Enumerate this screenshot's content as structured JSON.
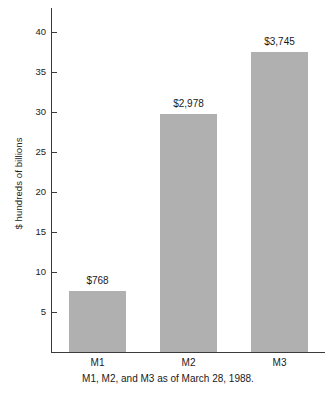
{
  "chart_data": {
    "type": "bar",
    "title": "",
    "subtitle": "",
    "xlabel": "",
    "ylabel": "$ hundreds of billions",
    "categories": [
      "M1",
      "M2",
      "M3"
    ],
    "values": [
      7.68,
      29.78,
      37.45
    ],
    "data_labels": [
      "$768",
      "$2,978",
      "$3,745"
    ],
    "ylim": [
      0,
      43
    ],
    "yticks": [
      5,
      10,
      15,
      20,
      25,
      30,
      35,
      40
    ],
    "ytick_labels": [
      "5",
      "10",
      "15",
      "20",
      "25",
      "30",
      "35",
      "40"
    ],
    "grid": false,
    "legend": false,
    "legend_position": "none",
    "caption": "M1, M2, and M3 as of March 28, 1988.",
    "bar_color": "#b0b0b0",
    "axis_color": "#3a3a3a",
    "background_color": "#ffffff",
    "series": [
      {
        "name": "Money supply",
        "values": [
          7.68,
          29.78,
          37.45
        ],
        "labels": [
          "$768",
          "$2,978",
          "$3,745"
        ]
      }
    ]
  }
}
